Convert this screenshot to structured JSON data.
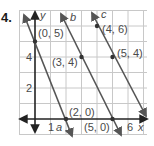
{
  "problem_number": "4.",
  "graph": {
    "axes": {
      "x_label": "x",
      "y_label": "y"
    },
    "tick_labels": {
      "x": [
        "1",
        "6"
      ],
      "y": [
        "2",
        "4"
      ]
    },
    "grid": {
      "x_range": [
        -1,
        7
      ],
      "y_range": [
        -1,
        7
      ],
      "step": 1
    },
    "lines": [
      {
        "name": "a",
        "points": [
          [
            0,
            5
          ],
          [
            2,
            0
          ]
        ],
        "slope": -2.5
      },
      {
        "name": "b",
        "points": [
          [
            3,
            4
          ],
          [
            5,
            0
          ]
        ],
        "slope": -2
      },
      {
        "name": "c",
        "points": [
          [
            4,
            6
          ],
          [
            5,
            4
          ]
        ],
        "slope": -2
      }
    ],
    "point_labels": {
      "p05": "(0, 5)",
      "p34": "(3, 4)",
      "p46": "(4, 6)",
      "p54": "(5, 4)",
      "p20": "(2, 0)",
      "p50": "(5, 0)"
    },
    "line_labels": {
      "a": "a",
      "b": "b",
      "c": "c"
    },
    "colors": {
      "grid": "#c8c8c8",
      "axis": "#222222",
      "line": "#555555",
      "point": "#333333"
    }
  }
}
